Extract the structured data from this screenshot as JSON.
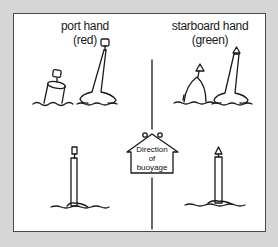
{
  "diagram": {
    "port": {
      "title": "port hand",
      "subtitle": "(red)",
      "color_name": "red"
    },
    "starboard": {
      "title": "starboard hand",
      "subtitle": "(green)",
      "color_name": "green"
    },
    "direction_sign": {
      "line1": "Direction",
      "line2": "of",
      "line3": "buoyage"
    }
  }
}
